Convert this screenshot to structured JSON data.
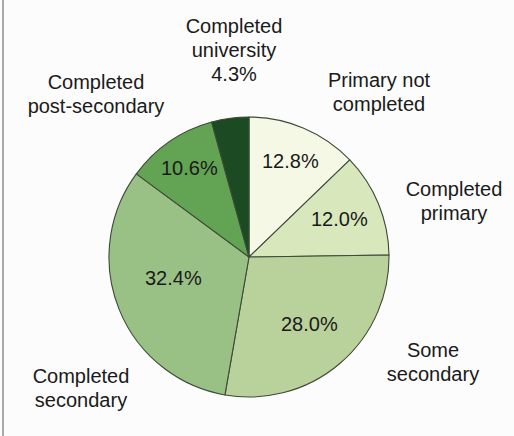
{
  "chart_data": {
    "type": "pie",
    "title": "",
    "start_angle": "12 o'clock",
    "direction": "clockwise",
    "slices": [
      {
        "label": "Primary not completed",
        "value": 12.8,
        "display": "12.8%",
        "color": "#f6f8e6"
      },
      {
        "label": "Completed primary",
        "value": 12.0,
        "display": "12.0%",
        "color": "#d9e7bc"
      },
      {
        "label": "Some secondary",
        "value": 28.0,
        "display": "28.0%",
        "color": "#b9d19b"
      },
      {
        "label": "Completed secondary",
        "value": 32.4,
        "display": "32.4%",
        "color": "#9ac185"
      },
      {
        "label": "Completed post-secondary",
        "value": 10.6,
        "display": "10.6%",
        "color": "#62a453"
      },
      {
        "label": "Completed university",
        "value": 4.3,
        "display": "4.3%",
        "color": "#1c4a22"
      }
    ],
    "categories": [
      "Primary not completed",
      "Completed primary",
      "Some secondary",
      "Completed secondary",
      "Completed post-secondary",
      "Completed university"
    ],
    "values": [
      12.8,
      12.0,
      28.0,
      32.4,
      10.6,
      4.3
    ],
    "legend": "none (labels placed around pie)"
  },
  "labels": {
    "primary_not_completed": {
      "line1": "Primary not",
      "line2": "completed"
    },
    "completed_primary": {
      "line1": "Completed",
      "line2": "primary"
    },
    "some_secondary": {
      "line1": "Some",
      "line2": "secondary"
    },
    "completed_secondary": {
      "line1": "Completed",
      "line2": "secondary"
    },
    "completed_post_secondary": {
      "line1": "Completed",
      "line2": "post-secondary"
    },
    "completed_university": {
      "line1": "Completed",
      "line2": "university",
      "line3": "4.3%"
    }
  },
  "percents": {
    "primary_not_completed": "12.8%",
    "completed_primary": "12.0%",
    "some_secondary": "28.0%",
    "completed_secondary": "32.4%",
    "completed_post_secondary": "10.6%"
  }
}
